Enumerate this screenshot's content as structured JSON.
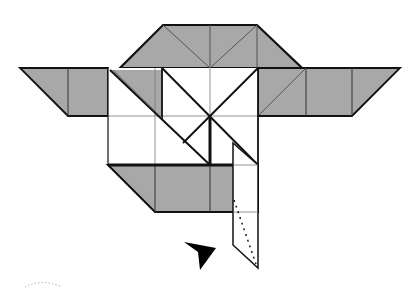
{
  "diagram": {
    "colors": {
      "background": "#ffffff",
      "colored_side": "#a8a8a8",
      "white_side": "#ffffff",
      "line": "#111111",
      "crease": "#555555",
      "arrow": "#000000"
    },
    "symbols": {
      "push_arrow": "push-arrow-icon",
      "valley_fold": "dotted valley fold line",
      "curved_arrow": "dotted curved motion arrow"
    }
  }
}
